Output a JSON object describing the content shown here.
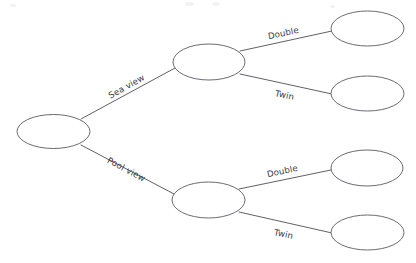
{
  "diagram": {
    "type": "tree-diagram",
    "title": "",
    "background_color": "#ffffff",
    "stroke_color": "#5a5a62",
    "text_color": "#3a3a40",
    "nodes": [
      {
        "id": "root",
        "label": "",
        "cx": 53.5,
        "cy": 131.5,
        "rx": 36.5,
        "ry": 17.0,
        "level": 0
      },
      {
        "id": "sea",
        "label": "",
        "cx": 209.0,
        "cy": 62.0,
        "rx": 36.0,
        "ry": 18.0,
        "level": 1
      },
      {
        "id": "pool",
        "label": "",
        "cx": 208.5,
        "cy": 200.0,
        "rx": 36.5,
        "ry": 18.0,
        "level": 1
      },
      {
        "id": "sea-double",
        "label": "",
        "cx": 367.5,
        "cy": 28.5,
        "rx": 36.5,
        "ry": 17.5,
        "level": 2
      },
      {
        "id": "sea-twin",
        "label": "",
        "cx": 367.5,
        "cy": 93.5,
        "rx": 36.5,
        "ry": 17.5,
        "level": 2
      },
      {
        "id": "pool-double",
        "label": "",
        "cx": 367.0,
        "cy": 168.0,
        "rx": 36.0,
        "ry": 18.0,
        "level": 2
      },
      {
        "id": "pool-twin",
        "label": "",
        "cx": 367.5,
        "cy": 232.5,
        "rx": 36.5,
        "ry": 17.5,
        "level": 2
      }
    ],
    "edges": [
      {
        "id": "edge-sea",
        "from": "root",
        "to": "sea",
        "label": "Sea view",
        "x1": 81,
        "y1": 119,
        "x2": 175,
        "y2": 68,
        "label_x": 128,
        "label_y": 89,
        "label_rotation": -29
      },
      {
        "id": "edge-pool",
        "from": "root",
        "to": "pool",
        "label": "Pool view",
        "x1": 81,
        "y1": 145,
        "x2": 174,
        "y2": 194,
        "label_x": 125,
        "label_y": 172,
        "label_rotation": 28
      },
      {
        "id": "edge-sea-double",
        "from": "sea",
        "to": "sea-double",
        "label": "Double",
        "x1": 240,
        "y1": 51,
        "x2": 332,
        "y2": 31,
        "label_x": 284,
        "label_y": 36,
        "label_rotation": -12
      },
      {
        "id": "edge-sea-twin",
        "from": "sea",
        "to": "sea-twin",
        "label": "Twin",
        "x1": 240,
        "y1": 74,
        "x2": 332,
        "y2": 94,
        "label_x": 284,
        "label_y": 98,
        "label_rotation": 12
      },
      {
        "id": "edge-pool-double",
        "from": "pool",
        "to": "pool-double",
        "label": "Double",
        "x1": 239,
        "y1": 189,
        "x2": 331,
        "y2": 170,
        "label_x": 283,
        "label_y": 174,
        "label_rotation": -12
      },
      {
        "id": "edge-pool-twin",
        "from": "pool",
        "to": "pool-twin",
        "label": "Twin",
        "x1": 239,
        "y1": 212,
        "x2": 332,
        "y2": 233,
        "label_x": 283,
        "label_y": 237,
        "label_rotation": 12
      }
    ]
  }
}
